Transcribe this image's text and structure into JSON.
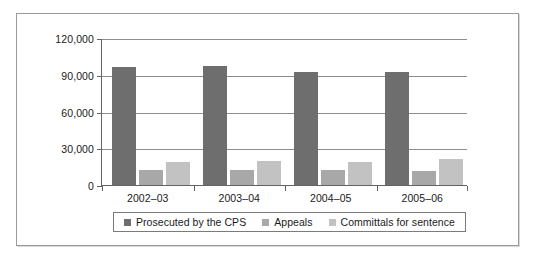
{
  "chart_data": {
    "type": "bar",
    "title": "",
    "subtitle": "",
    "xlabel": "",
    "ylabel": "",
    "categories": [
      "2002–03",
      "2003–04",
      "2004–05",
      "2005–06"
    ],
    "series": [
      {
        "name": "Prosecuted by the CPS",
        "color": "#6e6e6e",
        "values": [
          96000,
          97000,
          92000,
          92500
        ]
      },
      {
        "name": "Appeals",
        "color": "#a8a8a8",
        "values": [
          12000,
          12000,
          12000,
          11500
        ]
      },
      {
        "name": "Committals for sentence",
        "color": "#c2c2c2",
        "values": [
          19000,
          20000,
          19000,
          21000
        ]
      }
    ],
    "ylim": [
      0,
      120000
    ],
    "y_ticks": [
      0,
      30000,
      60000,
      90000,
      120000
    ],
    "y_tick_labels": [
      "0",
      "30,000",
      "60,000",
      "90,000",
      "120,000"
    ],
    "grid": true,
    "grid_axis": "y",
    "legend": {
      "position": "bottom",
      "entries": [
        {
          "label": "Prosecuted by the CPS",
          "color": "#6e6e6e"
        },
        {
          "label": "Appeals",
          "color": "#a8a8a8"
        },
        {
          "label": "Committals for sentence",
          "color": "#c2c2c2"
        }
      ]
    },
    "colors": {
      "axis": "#636363",
      "gridline": "#8d8d8d",
      "frame": "#9a9a9a",
      "text": "#1a1a1a",
      "background": "#ffffff"
    }
  }
}
